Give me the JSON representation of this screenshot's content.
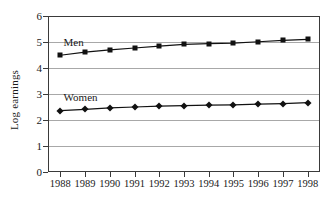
{
  "chart_data": {
    "type": "line",
    "title": "",
    "xlabel": "",
    "ylabel": "Log earnings",
    "x": [
      1988,
      1989,
      1990,
      1991,
      1992,
      1993,
      1994,
      1995,
      1996,
      1997,
      1998
    ],
    "xticklabels": [
      "1988",
      "1989",
      "1990",
      "1991",
      "1992",
      "1993",
      "1994",
      "1995",
      "1996",
      "1997",
      "1998"
    ],
    "yticklabels": [
      "0",
      "1",
      "2",
      "3",
      "4",
      "5",
      "6"
    ],
    "yticks": [
      0,
      1,
      2,
      3,
      4,
      5,
      6
    ],
    "ylim": [
      0,
      6
    ],
    "grid": "horizontal",
    "legend": "inline-labels",
    "series": [
      {
        "name": "Men",
        "marker": "square",
        "color": "#111111",
        "values": [
          4.49,
          4.61,
          4.7,
          4.77,
          4.84,
          4.91,
          4.94,
          4.96,
          5.01,
          5.06,
          5.1
        ]
      },
      {
        "name": "Women",
        "marker": "diamond",
        "color": "#111111",
        "values": [
          2.36,
          2.41,
          2.47,
          2.5,
          2.53,
          2.55,
          2.57,
          2.58,
          2.61,
          2.63,
          2.67
        ]
      }
    ],
    "annotations": [
      {
        "text": "Men",
        "x": 1988.05,
        "y": 4.96
      },
      {
        "text": "Women",
        "x": 1988.05,
        "y": 2.83
      }
    ]
  }
}
